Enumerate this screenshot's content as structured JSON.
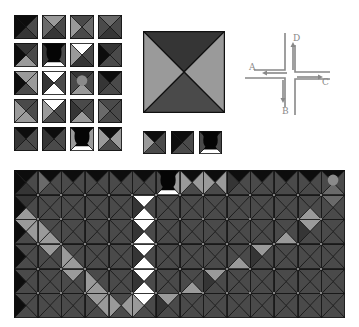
{
  "palette": {
    "K": "#0d0d0d",
    "D": "#353535",
    "M": "#4a4a4a",
    "G": "#6a6a6a",
    "L": "#9a9a9a",
    "W": "#ffffff"
  },
  "tile_legend": {
    "description": "Tile set: each tile is a square split into four triangles (top, right, bottom, left) with shade codes; overlay may be hole or agent",
    "rows": [
      [
        {
          "t": "K",
          "r": "M",
          "b": "D",
          "l": "K",
          "overlay": ""
        },
        {
          "t": "L",
          "r": "M",
          "b": "D",
          "l": "G",
          "overlay": ""
        },
        {
          "t": "M",
          "r": "G",
          "b": "M",
          "l": "L",
          "overlay": ""
        },
        {
          "t": "G",
          "r": "M",
          "b": "D",
          "l": "M",
          "overlay": ""
        }
      ],
      [
        {
          "t": "D",
          "r": "M",
          "b": "L",
          "l": "K",
          "overlay": ""
        },
        {
          "t": "K",
          "r": "M",
          "b": "W",
          "l": "D",
          "overlay": "hole"
        },
        {
          "t": "W",
          "r": "M",
          "b": "D",
          "l": "L",
          "overlay": ""
        },
        {
          "t": "D",
          "r": "M",
          "b": "M",
          "l": "K",
          "overlay": ""
        }
      ],
      [
        {
          "t": "L",
          "r": "L",
          "b": "M",
          "l": "K",
          "overlay": ""
        },
        {
          "t": "W",
          "r": "M",
          "b": "W",
          "l": "D",
          "overlay": ""
        },
        {
          "t": "D",
          "r": "M",
          "b": "L",
          "l": "M",
          "overlay": "agent"
        },
        {
          "t": "K",
          "r": "M",
          "b": "M",
          "l": "D",
          "overlay": ""
        }
      ],
      [
        {
          "t": "M",
          "r": "M",
          "b": "L",
          "l": "L",
          "overlay": ""
        },
        {
          "t": "W",
          "r": "M",
          "b": "M",
          "l": "L",
          "overlay": ""
        },
        {
          "t": "M",
          "r": "M",
          "b": "L",
          "l": "D",
          "overlay": ""
        },
        {
          "t": "M",
          "r": "M",
          "b": "M",
          "l": "G",
          "overlay": ""
        }
      ],
      [
        {
          "t": "K",
          "r": "M",
          "b": "M",
          "l": "D",
          "overlay": ""
        },
        {
          "t": "K",
          "r": "M",
          "b": "M",
          "l": "D",
          "overlay": ""
        },
        {
          "t": "K",
          "r": "L",
          "b": "W",
          "l": "L",
          "overlay": "hole"
        },
        {
          "t": "K",
          "r": "L",
          "b": "M",
          "l": "L",
          "overlay": ""
        }
      ]
    ]
  },
  "big_tile": {
    "t": "D",
    "r": "L",
    "b": "M",
    "l": "L",
    "overlay": ""
  },
  "small_tiles": [
    {
      "t": "K",
      "r": "M",
      "b": "M",
      "l": "L",
      "overlay": ""
    },
    {
      "t": "K",
      "r": "M",
      "b": "M",
      "l": "K",
      "overlay": ""
    },
    {
      "t": "K",
      "r": "M",
      "b": "W",
      "l": "M",
      "overlay": "hole"
    }
  ],
  "crossroads": {
    "labels": {
      "a": "A",
      "b": "B",
      "c": "C",
      "d": "D"
    }
  },
  "world": {
    "cols": 14,
    "rows_count": 6,
    "rows": [
      [
        {
          "t": "K",
          "r": "M",
          "b": "D",
          "l": "K",
          "overlay": ""
        },
        {
          "t": "K",
          "r": "M",
          "b": "M",
          "l": "G",
          "overlay": ""
        },
        {
          "t": "K",
          "r": "M",
          "b": "M",
          "l": "M",
          "overlay": ""
        },
        {
          "t": "K",
          "r": "M",
          "b": "M",
          "l": "M",
          "overlay": ""
        },
        {
          "t": "K",
          "r": "M",
          "b": "M",
          "l": "M",
          "overlay": ""
        },
        {
          "t": "K",
          "r": "M",
          "b": "M",
          "l": "M",
          "overlay": ""
        },
        {
          "t": "K",
          "r": "L",
          "b": "W",
          "l": "M",
          "overlay": "hole"
        },
        {
          "t": "K",
          "r": "L",
          "b": "M",
          "l": "L",
          "overlay": ""
        },
        {
          "t": "K",
          "r": "L",
          "b": "M",
          "l": "L",
          "overlay": ""
        },
        {
          "t": "K",
          "r": "M",
          "b": "M",
          "l": "D",
          "overlay": ""
        },
        {
          "t": "K",
          "r": "M",
          "b": "M",
          "l": "M",
          "overlay": ""
        },
        {
          "t": "K",
          "r": "M",
          "b": "M",
          "l": "M",
          "overlay": ""
        },
        {
          "t": "K",
          "r": "M",
          "b": "M",
          "l": "M",
          "overlay": ""
        },
        {
          "t": "K",
          "r": "M",
          "b": "G",
          "l": "M",
          "overlay": "agent"
        }
      ],
      [
        {
          "t": "D",
          "r": "M",
          "b": "L",
          "l": "K",
          "overlay": ""
        },
        {
          "t": "M",
          "r": "M",
          "b": "M",
          "l": "M",
          "overlay": ""
        },
        {
          "t": "M",
          "r": "M",
          "b": "M",
          "l": "M",
          "overlay": ""
        },
        {
          "t": "M",
          "r": "M",
          "b": "M",
          "l": "M",
          "overlay": ""
        },
        {
          "t": "M",
          "r": "M",
          "b": "M",
          "l": "M",
          "overlay": ""
        },
        {
          "t": "W",
          "r": "M",
          "b": "W",
          "l": "D",
          "overlay": ""
        },
        {
          "t": "M",
          "r": "M",
          "b": "M",
          "l": "M",
          "overlay": ""
        },
        {
          "t": "M",
          "r": "M",
          "b": "M",
          "l": "M",
          "overlay": ""
        },
        {
          "t": "M",
          "r": "M",
          "b": "M",
          "l": "M",
          "overlay": ""
        },
        {
          "t": "M",
          "r": "M",
          "b": "M",
          "l": "M",
          "overlay": ""
        },
        {
          "t": "M",
          "r": "M",
          "b": "M",
          "l": "M",
          "overlay": ""
        },
        {
          "t": "M",
          "r": "M",
          "b": "M",
          "l": "M",
          "overlay": ""
        },
        {
          "t": "M",
          "r": "M",
          "b": "L",
          "l": "M",
          "overlay": ""
        },
        {
          "t": "G",
          "r": "M",
          "b": "M",
          "l": "M",
          "overlay": ""
        }
      ],
      [
        {
          "t": "L",
          "r": "L",
          "b": "M",
          "l": "K",
          "overlay": ""
        },
        {
          "t": "M",
          "r": "M",
          "b": "L",
          "l": "L",
          "overlay": ""
        },
        {
          "t": "M",
          "r": "M",
          "b": "M",
          "l": "M",
          "overlay": ""
        },
        {
          "t": "M",
          "r": "M",
          "b": "M",
          "l": "M",
          "overlay": ""
        },
        {
          "t": "M",
          "r": "M",
          "b": "M",
          "l": "M",
          "overlay": ""
        },
        {
          "t": "W",
          "r": "M",
          "b": "W",
          "l": "D",
          "overlay": ""
        },
        {
          "t": "M",
          "r": "M",
          "b": "M",
          "l": "M",
          "overlay": ""
        },
        {
          "t": "M",
          "r": "M",
          "b": "M",
          "l": "M",
          "overlay": ""
        },
        {
          "t": "M",
          "r": "M",
          "b": "M",
          "l": "M",
          "overlay": ""
        },
        {
          "t": "M",
          "r": "M",
          "b": "M",
          "l": "M",
          "overlay": ""
        },
        {
          "t": "M",
          "r": "M",
          "b": "M",
          "l": "M",
          "overlay": ""
        },
        {
          "t": "M",
          "r": "M",
          "b": "L",
          "l": "M",
          "overlay": ""
        },
        {
          "t": "L",
          "r": "M",
          "b": "M",
          "l": "D",
          "overlay": ""
        },
        {
          "t": "M",
          "r": "M",
          "b": "M",
          "l": "M",
          "overlay": ""
        }
      ],
      [
        {
          "t": "M",
          "r": "M",
          "b": "M",
          "l": "K",
          "overlay": ""
        },
        {
          "t": "L",
          "r": "M",
          "b": "M",
          "l": "M",
          "overlay": ""
        },
        {
          "t": "M",
          "r": "M",
          "b": "L",
          "l": "L",
          "overlay": ""
        },
        {
          "t": "M",
          "r": "M",
          "b": "M",
          "l": "M",
          "overlay": ""
        },
        {
          "t": "M",
          "r": "M",
          "b": "M",
          "l": "M",
          "overlay": ""
        },
        {
          "t": "W",
          "r": "M",
          "b": "W",
          "l": "D",
          "overlay": ""
        },
        {
          "t": "M",
          "r": "M",
          "b": "M",
          "l": "M",
          "overlay": ""
        },
        {
          "t": "M",
          "r": "M",
          "b": "M",
          "l": "M",
          "overlay": ""
        },
        {
          "t": "M",
          "r": "M",
          "b": "M",
          "l": "M",
          "overlay": ""
        },
        {
          "t": "M",
          "r": "M",
          "b": "L",
          "l": "M",
          "overlay": ""
        },
        {
          "t": "L",
          "r": "M",
          "b": "M",
          "l": "D",
          "overlay": ""
        },
        {
          "t": "M",
          "r": "M",
          "b": "M",
          "l": "M",
          "overlay": ""
        },
        {
          "t": "M",
          "r": "M",
          "b": "M",
          "l": "M",
          "overlay": ""
        },
        {
          "t": "M",
          "r": "M",
          "b": "M",
          "l": "M",
          "overlay": ""
        }
      ],
      [
        {
          "t": "M",
          "r": "M",
          "b": "M",
          "l": "K",
          "overlay": ""
        },
        {
          "t": "M",
          "r": "M",
          "b": "M",
          "l": "M",
          "overlay": ""
        },
        {
          "t": "L",
          "r": "M",
          "b": "M",
          "l": "M",
          "overlay": ""
        },
        {
          "t": "M",
          "r": "M",
          "b": "L",
          "l": "L",
          "overlay": ""
        },
        {
          "t": "M",
          "r": "M",
          "b": "M",
          "l": "M",
          "overlay": ""
        },
        {
          "t": "W",
          "r": "M",
          "b": "W",
          "l": "D",
          "overlay": ""
        },
        {
          "t": "M",
          "r": "M",
          "b": "M",
          "l": "M",
          "overlay": ""
        },
        {
          "t": "M",
          "r": "M",
          "b": "L",
          "l": "M",
          "overlay": ""
        },
        {
          "t": "L",
          "r": "M",
          "b": "M",
          "l": "D",
          "overlay": ""
        },
        {
          "t": "M",
          "r": "M",
          "b": "M",
          "l": "M",
          "overlay": ""
        },
        {
          "t": "M",
          "r": "M",
          "b": "M",
          "l": "M",
          "overlay": ""
        },
        {
          "t": "M",
          "r": "M",
          "b": "M",
          "l": "M",
          "overlay": ""
        },
        {
          "t": "M",
          "r": "M",
          "b": "M",
          "l": "M",
          "overlay": ""
        },
        {
          "t": "M",
          "r": "M",
          "b": "M",
          "l": "M",
          "overlay": ""
        }
      ],
      [
        {
          "t": "M",
          "r": "M",
          "b": "M",
          "l": "K",
          "overlay": ""
        },
        {
          "t": "M",
          "r": "M",
          "b": "M",
          "l": "M",
          "overlay": ""
        },
        {
          "t": "M",
          "r": "M",
          "b": "M",
          "l": "M",
          "overlay": ""
        },
        {
          "t": "L",
          "r": "L",
          "b": "M",
          "l": "M",
          "overlay": ""
        },
        {
          "t": "M",
          "r": "L",
          "b": "M",
          "l": "L",
          "overlay": ""
        },
        {
          "t": "W",
          "r": "M",
          "b": "M",
          "l": "L",
          "overlay": ""
        },
        {
          "t": "L",
          "r": "M",
          "b": "M",
          "l": "D",
          "overlay": ""
        },
        {
          "t": "M",
          "r": "M",
          "b": "M",
          "l": "M",
          "overlay": ""
        },
        {
          "t": "M",
          "r": "M",
          "b": "M",
          "l": "M",
          "overlay": ""
        },
        {
          "t": "M",
          "r": "M",
          "b": "M",
          "l": "M",
          "overlay": ""
        },
        {
          "t": "M",
          "r": "M",
          "b": "M",
          "l": "M",
          "overlay": ""
        },
        {
          "t": "M",
          "r": "M",
          "b": "M",
          "l": "M",
          "overlay": ""
        },
        {
          "t": "M",
          "r": "M",
          "b": "M",
          "l": "M",
          "overlay": ""
        },
        {
          "t": "M",
          "r": "M",
          "b": "M",
          "l": "M",
          "overlay": ""
        }
      ]
    ]
  }
}
